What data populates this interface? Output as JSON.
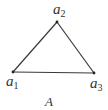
{
  "diagram": {
    "type": "triangle",
    "name": "A",
    "stroke_color": "#3a3a3a",
    "vertices": [
      {
        "id": "a1",
        "label_base": "a",
        "label_sub": "1",
        "x": 13,
        "y": 72
      },
      {
        "id": "a2",
        "label_base": "a",
        "label_sub": "2",
        "x": 57,
        "y": 22
      },
      {
        "id": "a3",
        "label_base": "a",
        "label_sub": "3",
        "x": 94,
        "y": 73
      }
    ],
    "edges": [
      [
        "a1",
        "a2"
      ],
      [
        "a2",
        "a3"
      ],
      [
        "a1",
        "a3"
      ]
    ],
    "caption": "A"
  }
}
